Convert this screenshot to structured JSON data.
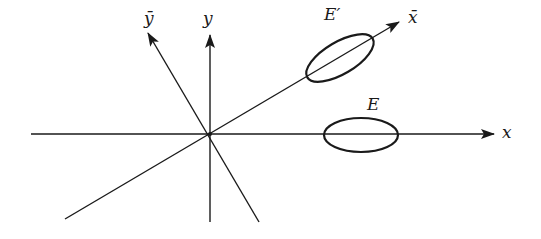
{
  "diagram": {
    "title": "",
    "colors": {
      "stroke": "#1a1a1a",
      "background": "#ffffff"
    },
    "origin": {
      "x": 210,
      "y": 134
    },
    "axes": [
      {
        "id": "x",
        "label": "x",
        "from": [
          31,
          134
        ],
        "to": [
          494,
          134
        ],
        "arrow": true
      },
      {
        "id": "y",
        "label": "y",
        "from": [
          210,
          222
        ],
        "to": [
          210,
          35
        ],
        "arrow": true
      },
      {
        "id": "x-bar",
        "label": "x̄",
        "from": [
          65,
          219
        ],
        "to": [
          399,
          22
        ],
        "arrow": true
      },
      {
        "id": "y-bar",
        "label": "ȳ",
        "from": [
          259,
          222
        ],
        "to": [
          148,
          33
        ],
        "arrow": true
      }
    ],
    "ellipses": [
      {
        "id": "E",
        "label": "E",
        "cx": 361,
        "cy": 135,
        "rx": 37,
        "ry": 17,
        "rotation_deg": 0
      },
      {
        "id": "E-prime",
        "label": "E′",
        "cx": 340,
        "cy": 58,
        "rx": 38,
        "ry": 16,
        "rotation_deg": -30.6
      }
    ],
    "labels": {
      "x": "x",
      "y": "y",
      "x_bar": "x̄",
      "y_bar": "ȳ",
      "E": "E",
      "E_prime": "E′"
    }
  }
}
